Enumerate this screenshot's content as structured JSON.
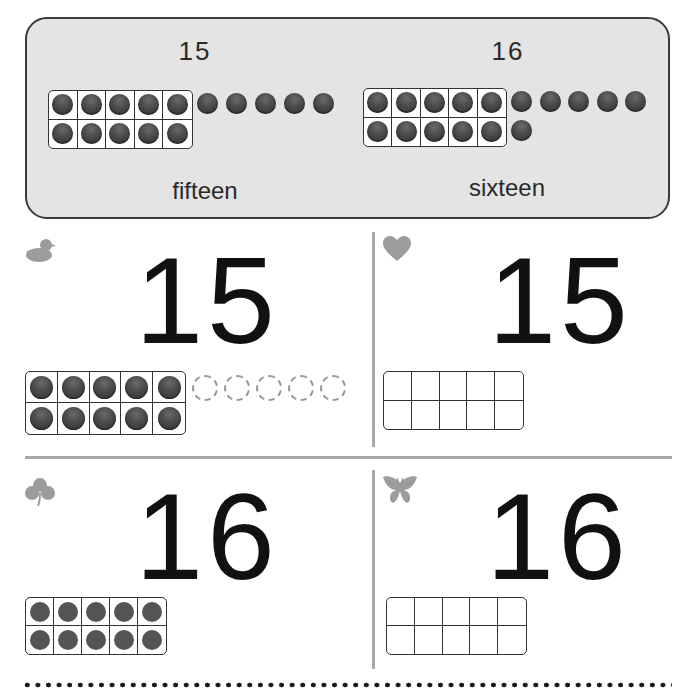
{
  "banner": {
    "left": {
      "numeral": "15",
      "word": "fifteen",
      "frame_filled": 10,
      "extra_counters": 5
    },
    "right": {
      "numeral": "16",
      "word": "sixteen",
      "frame_filled": 10,
      "extra_counters": 6
    }
  },
  "cards": [
    {
      "icon": "duck-icon",
      "numeral": "15",
      "frame_filled": 10,
      "ghost_counters": 5
    },
    {
      "icon": "heart-icon",
      "numeral": "15",
      "frame_filled": 0,
      "ghost_counters": 0
    },
    {
      "icon": "clover-icon",
      "numeral": "16",
      "frame_filled": 10,
      "ghost_counters": 0
    },
    {
      "icon": "butterfly-icon",
      "numeral": "16",
      "frame_filled": 0,
      "ghost_counters": 0
    }
  ],
  "colors": {
    "banner_bg": "#e4e4e4",
    "counter": "#444444",
    "divider": "#a9a9a9",
    "icon": "#9a9a9a"
  }
}
